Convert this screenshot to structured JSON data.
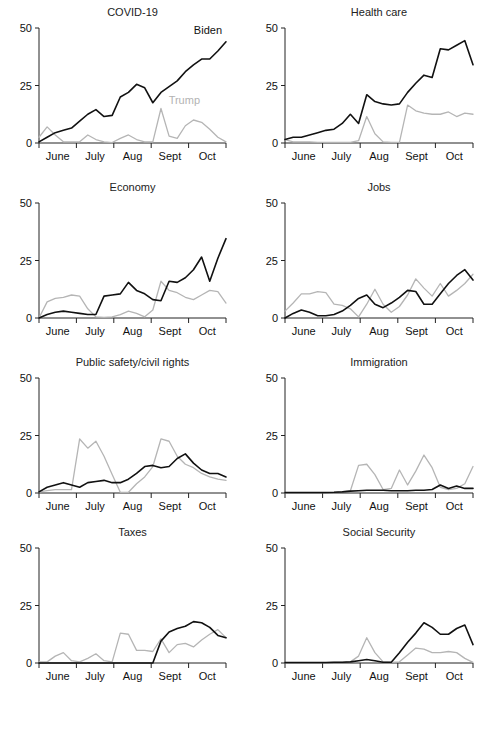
{
  "figure": {
    "series_names": [
      "Biden",
      "Trump"
    ],
    "series_colors": [
      "#111111",
      "#b5b5b5"
    ],
    "annotation_biden": "Biden",
    "annotation_trump": "Trump",
    "y_ticks": [
      "0",
      "25",
      "50"
    ],
    "x_ticks": [
      "June",
      "July",
      "Aug",
      "Sept",
      "Oct"
    ]
  },
  "chart_data": [
    {
      "type": "line",
      "title": "COVID-19",
      "xlabel": "",
      "ylabel": "",
      "ylim": [
        0,
        50
      ],
      "grid": false,
      "legend": "inline-annotations",
      "x": [
        "May 24",
        "May 31",
        "Jun 7",
        "Jun 14",
        "Jun 21",
        "Jun 28",
        "Jul 5",
        "Jul 12",
        "Jul 19",
        "Jul 26",
        "Aug 2",
        "Aug 9",
        "Aug 16",
        "Aug 23",
        "Aug 30",
        "Sep 6",
        "Sep 13",
        "Sep 20",
        "Sep 27",
        "Oct 4",
        "Oct 11",
        "Oct 18",
        "Oct 25",
        "Nov 1"
      ],
      "series": [
        {
          "name": "Biden",
          "values": [
            0.5,
            2.5,
            4.5,
            5.5,
            6.5,
            9.5,
            12.5,
            14.5,
            11.5,
            12.0,
            20.0,
            22.0,
            25.5,
            24.0,
            17.5,
            22.0,
            24.5,
            27.0,
            31.0,
            34.0,
            36.5,
            36.5,
            40.0,
            44.0
          ]
        },
        {
          "name": "Trump",
          "values": [
            2.5,
            7.0,
            3.5,
            0.5,
            0.5,
            0.5,
            3.5,
            1.5,
            0.5,
            0.2,
            2.0,
            3.5,
            1.5,
            0.5,
            0.5,
            15.0,
            3.0,
            2.0,
            7.5,
            10.0,
            9.0,
            6.0,
            2.5,
            0.5
          ]
        }
      ]
    },
    {
      "type": "line",
      "title": "Health care",
      "xlabel": "",
      "ylabel": "",
      "ylim": [
        0,
        50
      ],
      "grid": false,
      "x": [
        "May 24",
        "May 31",
        "Jun 7",
        "Jun 14",
        "Jun 21",
        "Jun 28",
        "Jul 5",
        "Jul 12",
        "Jul 19",
        "Jul 26",
        "Aug 2",
        "Aug 9",
        "Aug 16",
        "Aug 23",
        "Aug 30",
        "Sep 6",
        "Sep 13",
        "Sep 20",
        "Sep 27",
        "Oct 4",
        "Oct 11",
        "Oct 18",
        "Oct 25",
        "Nov 1"
      ],
      "series": [
        {
          "name": "Biden",
          "values": [
            1.5,
            2.5,
            2.5,
            3.5,
            4.5,
            5.5,
            6.0,
            8.5,
            12.5,
            8.5,
            21.0,
            18.0,
            17.0,
            16.5,
            17.0,
            22.0,
            26.0,
            29.5,
            28.5,
            41.0,
            40.5,
            42.5,
            44.5,
            34.0
          ]
        },
        {
          "name": "Trump",
          "values": [
            1.5,
            0.5,
            0.5,
            0.5,
            0.3,
            0.3,
            0.3,
            0.3,
            0.3,
            1.0,
            11.5,
            4.0,
            0.5,
            0.3,
            0.3,
            16.5,
            14.0,
            13.0,
            12.5,
            12.5,
            13.5,
            11.5,
            13.0,
            12.5
          ]
        }
      ]
    },
    {
      "type": "line",
      "title": "Economy",
      "xlabel": "",
      "ylabel": "",
      "ylim": [
        0,
        50
      ],
      "grid": false,
      "x": [
        "May 24",
        "May 31",
        "Jun 7",
        "Jun 14",
        "Jun 21",
        "Jun 28",
        "Jul 5",
        "Jul 12",
        "Jul 19",
        "Jul 26",
        "Aug 2",
        "Aug 9",
        "Aug 16",
        "Aug 23",
        "Aug 30",
        "Sep 6",
        "Sep 13",
        "Sep 20",
        "Sep 27",
        "Oct 4",
        "Oct 11",
        "Oct 18",
        "Oct 25",
        "Nov 1"
      ],
      "series": [
        {
          "name": "Biden",
          "values": [
            0.0,
            1.5,
            2.5,
            3.0,
            2.5,
            2.0,
            1.5,
            1.5,
            9.5,
            10.0,
            10.5,
            15.5,
            12.0,
            10.5,
            8.0,
            7.5,
            16.0,
            15.5,
            17.5,
            21.0,
            26.5,
            16.0,
            26.0,
            34.5
          ]
        },
        {
          "name": "Trump",
          "values": [
            0.0,
            7.0,
            8.5,
            9.0,
            10.0,
            9.5,
            4.0,
            0.5,
            0.3,
            0.5,
            1.5,
            3.0,
            2.0,
            0.5,
            3.5,
            16.0,
            12.0,
            11.0,
            9.0,
            8.0,
            10.0,
            12.0,
            11.5,
            6.5
          ]
        }
      ]
    },
    {
      "type": "line",
      "title": "Jobs",
      "xlabel": "",
      "ylabel": "",
      "ylim": [
        0,
        50
      ],
      "grid": false,
      "x": [
        "May 24",
        "May 31",
        "Jun 7",
        "Jun 14",
        "Jun 21",
        "Jun 28",
        "Jul 5",
        "Jul 12",
        "Jul 19",
        "Jul 26",
        "Aug 2",
        "Aug 9",
        "Aug 16",
        "Aug 23",
        "Aug 30",
        "Sep 6",
        "Sep 13",
        "Sep 20",
        "Sep 27",
        "Oct 4",
        "Oct 11",
        "Oct 18",
        "Oct 25",
        "Nov 1"
      ],
      "series": [
        {
          "name": "Biden",
          "values": [
            0.0,
            2.0,
            3.5,
            2.5,
            1.0,
            1.0,
            1.5,
            3.0,
            5.5,
            8.5,
            10.0,
            6.0,
            4.5,
            6.5,
            9.0,
            12.0,
            11.5,
            6.0,
            6.0,
            10.5,
            15.0,
            18.5,
            21.0,
            16.5
          ]
        },
        {
          "name": "Trump",
          "values": [
            3.0,
            6.5,
            10.5,
            10.5,
            11.5,
            11.0,
            6.0,
            5.5,
            4.0,
            0.5,
            6.0,
            12.5,
            6.0,
            2.5,
            5.0,
            10.0,
            17.0,
            13.0,
            9.5,
            15.0,
            9.5,
            12.0,
            15.0,
            19.0
          ]
        }
      ]
    },
    {
      "type": "line",
      "title": "Public safety/civil rights",
      "xlabel": "",
      "ylabel": "",
      "ylim": [
        0,
        50
      ],
      "grid": false,
      "x": [
        "May 24",
        "May 31",
        "Jun 7",
        "Jun 14",
        "Jun 21",
        "Jun 28",
        "Jul 5",
        "Jul 12",
        "Jul 19",
        "Jul 26",
        "Aug 2",
        "Aug 9",
        "Aug 16",
        "Aug 23",
        "Aug 30",
        "Sep 6",
        "Sep 13",
        "Sep 20",
        "Sep 27",
        "Oct 4",
        "Oct 11",
        "Oct 18",
        "Oct 25",
        "Nov 1"
      ],
      "series": [
        {
          "name": "Biden",
          "values": [
            0.5,
            2.5,
            3.5,
            4.5,
            3.5,
            2.5,
            4.5,
            5.0,
            5.5,
            4.5,
            4.5,
            6.0,
            8.5,
            11.5,
            12.0,
            11.0,
            11.5,
            15.0,
            17.0,
            13.0,
            10.0,
            8.5,
            8.5,
            7.0
          ]
        },
        {
          "name": "Trump",
          "values": [
            0.5,
            1.0,
            1.5,
            1.5,
            1.5,
            23.5,
            19.5,
            22.5,
            16.0,
            8.0,
            0.3,
            0.3,
            4.0,
            7.0,
            11.5,
            23.5,
            22.5,
            16.0,
            12.5,
            11.0,
            8.5,
            7.0,
            6.0,
            5.5
          ]
        }
      ]
    },
    {
      "type": "line",
      "title": "Immigration",
      "xlabel": "",
      "ylabel": "",
      "ylim": [
        0,
        50
      ],
      "grid": false,
      "x": [
        "May 24",
        "May 31",
        "Jun 7",
        "Jun 14",
        "Jun 21",
        "Jun 28",
        "Jul 5",
        "Jul 12",
        "Jul 19",
        "Jul 26",
        "Aug 2",
        "Aug 9",
        "Aug 16",
        "Aug 23",
        "Aug 30",
        "Sep 6",
        "Sep 13",
        "Sep 20",
        "Sep 27",
        "Oct 4",
        "Oct 11",
        "Oct 18",
        "Oct 25",
        "Nov 1"
      ],
      "series": [
        {
          "name": "Biden",
          "values": [
            0.2,
            0.2,
            0.2,
            0.2,
            0.2,
            0.2,
            0.3,
            0.5,
            0.8,
            1.0,
            1.2,
            1.2,
            1.2,
            1.0,
            1.0,
            1.0,
            1.2,
            1.2,
            1.5,
            3.5,
            2.0,
            3.0,
            2.0,
            2.0
          ]
        },
        {
          "name": "Trump",
          "values": [
            0.2,
            0.2,
            0.2,
            0.2,
            0.2,
            0.2,
            0.3,
            0.5,
            1.0,
            12.0,
            12.5,
            8.0,
            1.5,
            2.0,
            10.0,
            3.5,
            9.5,
            16.5,
            11.0,
            2.5,
            1.5,
            2.0,
            4.0,
            11.5
          ]
        }
      ]
    },
    {
      "type": "line",
      "title": "Taxes",
      "xlabel": "",
      "ylabel": "",
      "ylim": [
        0,
        50
      ],
      "grid": false,
      "x": [
        "May 24",
        "May 31",
        "Jun 7",
        "Jun 14",
        "Jun 21",
        "Jun 28",
        "Jul 5",
        "Jul 12",
        "Jul 19",
        "Jul 26",
        "Aug 2",
        "Aug 9",
        "Aug 16",
        "Aug 23",
        "Aug 30",
        "Sep 6",
        "Sep 13",
        "Sep 20",
        "Sep 27",
        "Oct 4",
        "Oct 11",
        "Oct 18",
        "Oct 25",
        "Nov 1"
      ],
      "series": [
        {
          "name": "Biden",
          "values": [
            0.0,
            0.0,
            0.0,
            0.0,
            0.0,
            0.0,
            0.0,
            0.0,
            0.0,
            0.0,
            0.0,
            0.0,
            0.0,
            0.0,
            0.0,
            9.5,
            13.5,
            15.0,
            16.0,
            18.0,
            17.5,
            15.5,
            12.0,
            11.0
          ]
        },
        {
          "name": "Trump",
          "values": [
            0.5,
            0.5,
            3.0,
            4.5,
            1.0,
            0.5,
            2.0,
            4.0,
            1.0,
            0.5,
            13.0,
            12.5,
            5.5,
            5.5,
            5.0,
            10.5,
            4.5,
            8.0,
            8.5,
            7.0,
            10.0,
            12.5,
            14.5,
            11.0
          ]
        }
      ]
    },
    {
      "type": "line",
      "title": "Social Security",
      "xlabel": "",
      "ylabel": "",
      "ylim": [
        0,
        50
      ],
      "grid": false,
      "x": [
        "May 24",
        "May 31",
        "Jun 7",
        "Jun 14",
        "Jun 21",
        "Jun 28",
        "Jul 5",
        "Jul 12",
        "Jul 19",
        "Jul 26",
        "Aug 2",
        "Aug 9",
        "Aug 16",
        "Aug 23",
        "Aug 30",
        "Sep 6",
        "Sep 13",
        "Sep 20",
        "Sep 27",
        "Oct 4",
        "Oct 11",
        "Oct 18",
        "Oct 25",
        "Nov 1"
      ],
      "series": [
        {
          "name": "Biden",
          "values": [
            0.2,
            0.2,
            0.2,
            0.2,
            0.2,
            0.2,
            0.3,
            0.3,
            0.5,
            1.0,
            1.5,
            1.0,
            0.3,
            0.3,
            4.5,
            9.0,
            13.0,
            17.5,
            15.5,
            12.5,
            12.5,
            15.0,
            16.5,
            8.0
          ]
        },
        {
          "name": "Trump",
          "values": [
            0.2,
            0.2,
            0.2,
            0.2,
            0.2,
            0.2,
            0.3,
            0.3,
            0.5,
            3.0,
            11.0,
            4.5,
            0.5,
            0.3,
            0.5,
            3.5,
            6.5,
            6.0,
            4.5,
            4.5,
            5.0,
            4.5,
            2.0,
            0.3
          ]
        }
      ]
    }
  ]
}
